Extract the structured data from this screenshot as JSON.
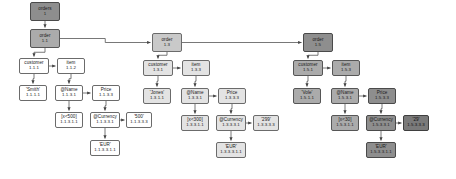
{
  "diagram": {
    "type": "tree",
    "background": "#ffffff",
    "edge_color": "#555555",
    "shade_levels": [
      "#ffffff",
      "#e3e3e3",
      "#c9c9c9",
      "#ababab",
      "#8e8e8e",
      "#7a7a7a"
    ]
  },
  "nodes": [
    {
      "key": "root",
      "label": "orders",
      "id": "1",
      "x": 30,
      "y": 2,
      "w": 30,
      "h": 19,
      "shade": 4
    },
    {
      "key": "o11",
      "label": "order",
      "id": "1.1",
      "x": 30,
      "y": 29,
      "w": 30,
      "h": 19,
      "shade": 3
    },
    {
      "key": "cust11",
      "label": "customer",
      "id": "1.1.1",
      "x": 19,
      "y": 58,
      "w": 30,
      "h": 16,
      "shade": 0
    },
    {
      "key": "item11",
      "label": "item",
      "id": "1.1.2",
      "x": 57,
      "y": 58,
      "w": 28,
      "h": 16,
      "shade": 0
    },
    {
      "key": "smith",
      "label": "'Smith'",
      "id": "1.1.1.1",
      "x": 19,
      "y": 85,
      "w": 28,
      "h": 16,
      "shade": 0
    },
    {
      "key": "name11",
      "label": "@Name",
      "id": "1.1.3.1",
      "x": 55,
      "y": 85,
      "w": 28,
      "h": 16,
      "shade": 0
    },
    {
      "key": "price11",
      "label": "Price",
      "id": "1.1.3.3",
      "x": 92,
      "y": 85,
      "w": 28,
      "h": 16,
      "shade": 0
    },
    {
      "key": "x500",
      "label": "[x<500]",
      "id": "1.1.3.1.1",
      "x": 55,
      "y": 112,
      "w": 28,
      "h": 16,
      "shade": 0
    },
    {
      "key": "curr11",
      "label": "@Currency",
      "id": "1.1.3.3.1",
      "x": 90,
      "y": 112,
      "w": 30,
      "h": 16,
      "shade": 0
    },
    {
      "key": "v500",
      "label": "'500'",
      "id": "1.1.3.3.3",
      "x": 126,
      "y": 112,
      "w": 26,
      "h": 16,
      "shade": 0
    },
    {
      "key": "eur11",
      "label": "'EUR'",
      "id": "1.1.3.3.1.1",
      "x": 90,
      "y": 140,
      "w": 30,
      "h": 16,
      "shade": 0
    },
    {
      "key": "o13",
      "label": "order",
      "id": "1.3",
      "x": 152,
      "y": 33,
      "w": 30,
      "h": 19,
      "shade": 2
    },
    {
      "key": "cust13",
      "label": "customer",
      "id": "1.3.1",
      "x": 143,
      "y": 60,
      "w": 30,
      "h": 16,
      "shade": 1
    },
    {
      "key": "item13",
      "label": "item",
      "id": "1.3.3",
      "x": 182,
      "y": 60,
      "w": 28,
      "h": 16,
      "shade": 1
    },
    {
      "key": "jones",
      "label": "'Jones'",
      "id": "1.3.1.1",
      "x": 143,
      "y": 88,
      "w": 28,
      "h": 16,
      "shade": 1
    },
    {
      "key": "name13",
      "label": "@Name",
      "id": "1.3.3.1",
      "x": 181,
      "y": 88,
      "w": 28,
      "h": 16,
      "shade": 1
    },
    {
      "key": "price13",
      "label": "Price",
      "id": "1.3.3.3",
      "x": 218,
      "y": 88,
      "w": 28,
      "h": 16,
      "shade": 1
    },
    {
      "key": "x300",
      "label": "[x<300]",
      "id": "1.3.3.1.1",
      "x": 181,
      "y": 115,
      "w": 28,
      "h": 16,
      "shade": 1
    },
    {
      "key": "curr13",
      "label": "@Currency",
      "id": "1.3.3.3.1",
      "x": 216,
      "y": 115,
      "w": 30,
      "h": 16,
      "shade": 1
    },
    {
      "key": "v299",
      "label": "'299'",
      "id": "1.3.3.3.3",
      "x": 253,
      "y": 115,
      "w": 26,
      "h": 16,
      "shade": 1
    },
    {
      "key": "eur13",
      "label": "'EUR'",
      "id": "1.3.3.3.1.1",
      "x": 216,
      "y": 142,
      "w": 30,
      "h": 16,
      "shade": 1
    },
    {
      "key": "o15",
      "label": "order",
      "id": "1.5",
      "x": 303,
      "y": 33,
      "w": 30,
      "h": 19,
      "shade": 4
    },
    {
      "key": "cust15",
      "label": "customer",
      "id": "1.5.1",
      "x": 293,
      "y": 60,
      "w": 30,
      "h": 16,
      "shade": 3
    },
    {
      "key": "item15",
      "label": "item",
      "id": "1.5.3",
      "x": 332,
      "y": 60,
      "w": 28,
      "h": 16,
      "shade": 3
    },
    {
      "key": "vole",
      "label": "'Vole'",
      "id": "1.5.1.1",
      "x": 293,
      "y": 88,
      "w": 28,
      "h": 16,
      "shade": 3
    },
    {
      "key": "name15",
      "label": "@Name",
      "id": "1.5.3.1",
      "x": 331,
      "y": 88,
      "w": 28,
      "h": 16,
      "shade": 3
    },
    {
      "key": "price15",
      "label": "Price",
      "id": "1.5.3.3",
      "x": 368,
      "y": 88,
      "w": 28,
      "h": 16,
      "shade": 4
    },
    {
      "key": "x30",
      "label": "[x<30]",
      "id": "1.5.3.1.1",
      "x": 331,
      "y": 115,
      "w": 28,
      "h": 16,
      "shade": 3
    },
    {
      "key": "curr15",
      "label": "@Currency",
      "id": "1.5.3.3.1",
      "x": 366,
      "y": 115,
      "w": 30,
      "h": 16,
      "shade": 4
    },
    {
      "key": "v29",
      "label": "'29'",
      "id": "1.5.3.3.3",
      "x": 403,
      "y": 115,
      "w": 26,
      "h": 16,
      "shade": 5
    },
    {
      "key": "eur15",
      "label": "'EUR'",
      "id": "1.5.3.3.1.1",
      "x": 366,
      "y": 142,
      "w": 30,
      "h": 16,
      "shade": 4
    }
  ],
  "edges": [
    {
      "from": "root",
      "to": "o11",
      "dir": "v"
    },
    {
      "from": "o11",
      "to": "cust11",
      "dir": "v"
    },
    {
      "from": "cust11",
      "to": "item11",
      "dir": "h"
    },
    {
      "from": "cust11",
      "to": "smith",
      "dir": "v"
    },
    {
      "from": "item11",
      "to": "name11",
      "dir": "v"
    },
    {
      "from": "name11",
      "to": "price11",
      "dir": "h"
    },
    {
      "from": "name11",
      "to": "x500",
      "dir": "v"
    },
    {
      "from": "price11",
      "to": "curr11",
      "dir": "v"
    },
    {
      "from": "curr11",
      "to": "v500",
      "dir": "h"
    },
    {
      "from": "curr11",
      "to": "eur11",
      "dir": "v"
    },
    {
      "from": "o11",
      "to": "o13",
      "dir": "h"
    },
    {
      "from": "o13",
      "to": "cust13",
      "dir": "v"
    },
    {
      "from": "cust13",
      "to": "item13",
      "dir": "h"
    },
    {
      "from": "cust13",
      "to": "jones",
      "dir": "v"
    },
    {
      "from": "item13",
      "to": "name13",
      "dir": "v"
    },
    {
      "from": "name13",
      "to": "price13",
      "dir": "h"
    },
    {
      "from": "name13",
      "to": "x300",
      "dir": "v"
    },
    {
      "from": "price13",
      "to": "curr13",
      "dir": "v"
    },
    {
      "from": "curr13",
      "to": "v299",
      "dir": "h"
    },
    {
      "from": "curr13",
      "to": "eur13",
      "dir": "v"
    },
    {
      "from": "o13",
      "to": "o15",
      "dir": "h"
    },
    {
      "from": "o15",
      "to": "cust15",
      "dir": "v"
    },
    {
      "from": "cust15",
      "to": "item15",
      "dir": "h"
    },
    {
      "from": "cust15",
      "to": "vole",
      "dir": "v"
    },
    {
      "from": "item15",
      "to": "name15",
      "dir": "v"
    },
    {
      "from": "name15",
      "to": "price15",
      "dir": "h"
    },
    {
      "from": "name15",
      "to": "x30",
      "dir": "v"
    },
    {
      "from": "price15",
      "to": "curr15",
      "dir": "v"
    },
    {
      "from": "curr15",
      "to": "v29",
      "dir": "h"
    },
    {
      "from": "curr15",
      "to": "eur15",
      "dir": "v"
    }
  ]
}
